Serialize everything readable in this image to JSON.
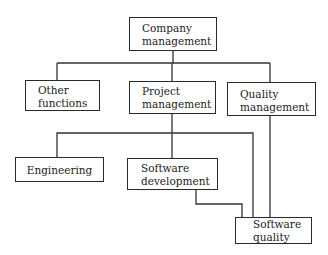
{
  "diagram": {
    "type": "org-chart",
    "nodes": [
      {
        "id": "company",
        "label_line1": "Company",
        "label_line2": "management"
      },
      {
        "id": "other",
        "label_line1": "Other",
        "label_line2": "functions"
      },
      {
        "id": "project",
        "label_line1": "Project",
        "label_line2": "management"
      },
      {
        "id": "quality",
        "label_line1": "Quality",
        "label_line2": "management"
      },
      {
        "id": "engineering",
        "label_line1": "Engineering",
        "label_line2": ""
      },
      {
        "id": "swdev",
        "label_line1": "Software",
        "label_line2": "development"
      },
      {
        "id": "swquality",
        "label_line1": "Software",
        "label_line2": "quality"
      }
    ],
    "edges": [
      {
        "from": "company",
        "to": "other"
      },
      {
        "from": "company",
        "to": "project"
      },
      {
        "from": "company",
        "to": "quality"
      },
      {
        "from": "project",
        "to": "engineering"
      },
      {
        "from": "project",
        "to": "swdev"
      },
      {
        "from": "project",
        "to": "swquality"
      },
      {
        "from": "swdev",
        "to": "swquality"
      },
      {
        "from": "quality",
        "to": "swquality"
      }
    ]
  }
}
